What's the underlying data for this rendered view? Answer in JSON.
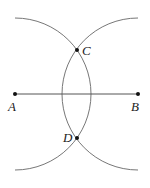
{
  "diagram": {
    "type": "perpendicular-bisector-construction",
    "colors": {
      "line": "#555555",
      "arc": "#777777",
      "point": "#111111",
      "text": "#222222"
    },
    "points": {
      "A": {
        "label": "A",
        "x": 15,
        "y": 94
      },
      "B": {
        "label": "B",
        "x": 138,
        "y": 94
      },
      "C": {
        "label": "C",
        "x": 77,
        "y": 50
      },
      "D": {
        "label": "D",
        "x": 77,
        "y": 138
      }
    },
    "segment": {
      "from": "A",
      "to": "B"
    },
    "arcs": [
      {
        "center": "A",
        "radius": 76
      },
      {
        "center": "B",
        "radius": 76
      }
    ]
  }
}
